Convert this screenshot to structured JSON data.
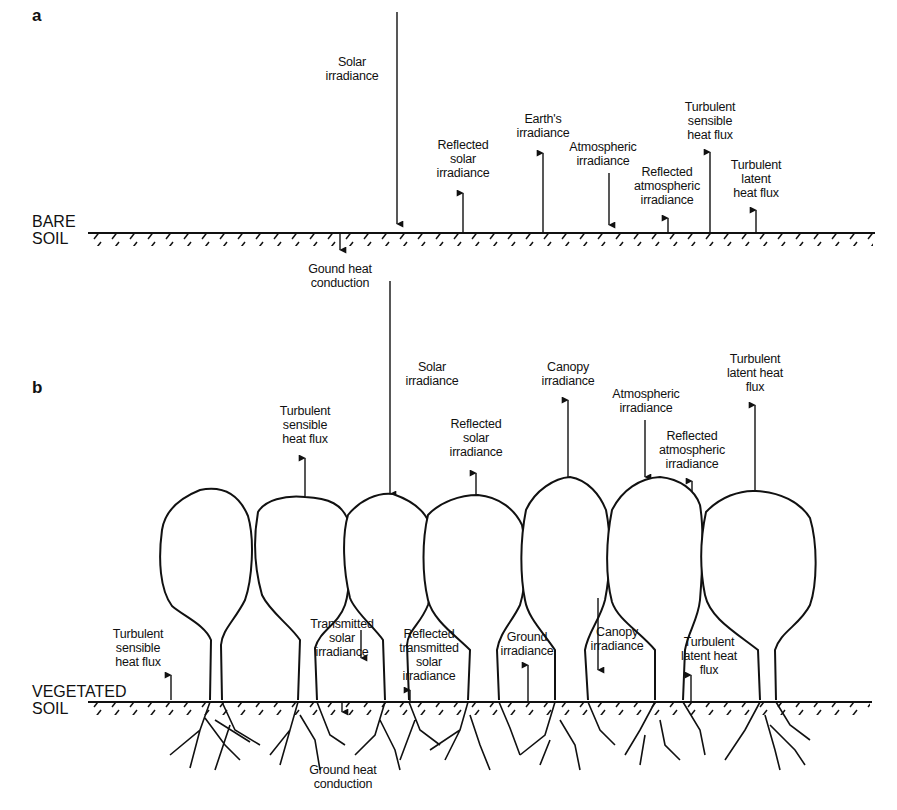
{
  "panel_a": {
    "letter": "a",
    "soil_label_1": "BARE",
    "soil_label_2": "SOIL",
    "labels": {
      "solar": "Solar\nirradiance",
      "reflected_solar": "Reflected\nsolar\nirradiance",
      "earths": "Earth's\nirradiance",
      "atmospheric": "Atmospheric\nirradiance",
      "reflected_atmospheric": "Reflected\natmospheric\nirradiance",
      "turbulent_sensible": "Turbulent\nsensible\nheat flux",
      "turbulent_latent": "Turbulent\nlatent\nheat flux",
      "ground_heat": "Gound heat\nconduction"
    }
  },
  "panel_b": {
    "letter": "b",
    "soil_label_1": "VEGETATED",
    "soil_label_2": "SOIL",
    "labels": {
      "solar": "Solar\nirradiance",
      "turbulent_sensible_top": "Turbulent\nsensible\nheat flux",
      "reflected_solar": "Reflected\nsolar\nirradiance",
      "canopy_up": "Canopy\nirradiance",
      "atmospheric": "Atmospheric\nirradiance",
      "reflected_atmospheric": "Reflected\natmospheric\nirradiance",
      "turbulent_latent_top": "Turbulent\nlatent heat\nflux",
      "turbulent_sensible_bottom": "Turbulent\nsensible\nheat flux",
      "transmitted_solar": "Transmitted\nsolar\nirradiance",
      "reflected_transmitted": "Reflected\ntransmitted\nsolar\nirradiance",
      "ground_irradiance": "Ground\nirradiance",
      "canopy_down": "Canopy\nirradiance",
      "turbulent_latent_bottom": "Turbulent\nlatent heat\nflux",
      "ground_heat": "Ground heat\nconduction"
    }
  }
}
